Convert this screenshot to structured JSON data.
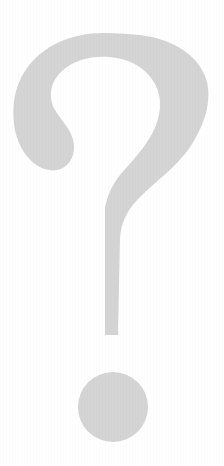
{
  "canvas": {
    "width": 224,
    "height": 466,
    "background_color": "#ffffff",
    "alt_text": "Question mark"
  },
  "glyph": {
    "name": "question-mark",
    "character": "?",
    "fill_color": "#d4d4d4",
    "bounds": {
      "x": 12,
      "y": 33,
      "width": 200,
      "height": 409
    },
    "parts": [
      {
        "name": "hook",
        "description": "Upper curved arc of the question mark, thickest on the right side",
        "bounds": {
          "x": 12,
          "y": 33,
          "width": 200,
          "height": 137
        }
      },
      {
        "name": "counter",
        "description": "White enclosed space inside the hook",
        "fill_color": "#ffffff",
        "bounds": {
          "x": 50,
          "y": 57,
          "width": 104,
          "height": 95
        }
      },
      {
        "name": "left-terminal",
        "description": "Rounded teardrop lobe at the lower-left end of the hook",
        "bounds": {
          "x": 14,
          "y": 96,
          "width": 58,
          "height": 74
        }
      },
      {
        "name": "stem",
        "description": "Tapering descender running from upper-right down to a narrow flat tip",
        "bounds": {
          "x": 105,
          "y": 148,
          "width": 85,
          "height": 187
        }
      },
      {
        "name": "dot",
        "description": "Circular dot below the stem",
        "shape": "circle",
        "center_x": 113,
        "center_y": 407,
        "radius": 35
      }
    ]
  }
}
